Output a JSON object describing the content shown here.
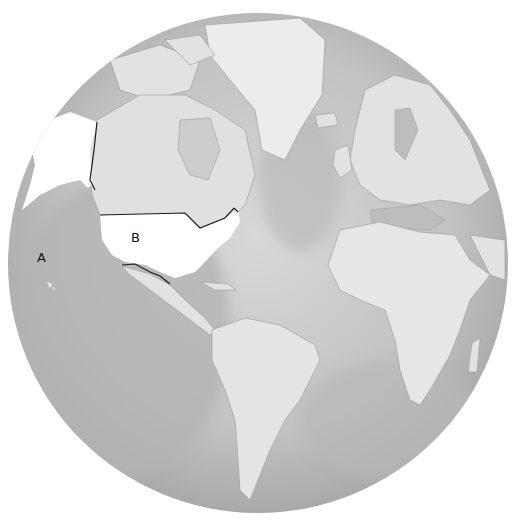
{
  "map": {
    "projection": "orthographic globe",
    "colors": {
      "background": "#ffffff",
      "ocean_light": "#d4d4d4",
      "ocean_dark": "#a8a8a8",
      "land": "#e2e2e2",
      "highlight": "#ffffff",
      "border": "#1a1a1a",
      "coast": "#8c8c8c"
    },
    "labels": [
      {
        "id": "A",
        "text": "A",
        "location": "Pacific Ocean (Hawaii)"
      },
      {
        "id": "B",
        "text": "B",
        "location": "Contiguous United States"
      }
    ],
    "highlighted_regions": [
      "Alaska",
      "Contiguous United States"
    ]
  }
}
